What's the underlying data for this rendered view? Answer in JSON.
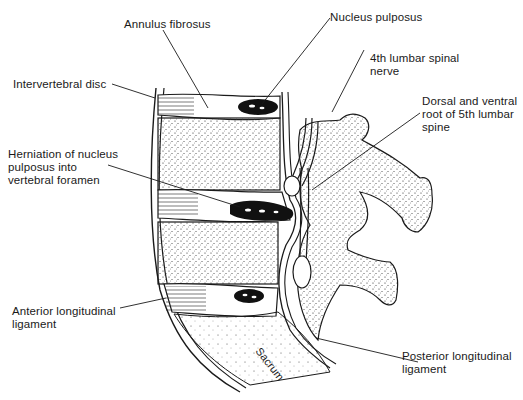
{
  "figure": {
    "type": "anatomical-diagram"
  },
  "labels": {
    "annulus_fibrosus": "Annulus fibrosus",
    "nucleus_pulposus": "Nucleus pulposus",
    "intervertebral_disc": "Intervertebral disc",
    "fourth_lumbar_nerve": "4th lumbar spinal\nnerve",
    "dorsal_ventral_root": "Dorsal and ventral\nroot of 5th lumbar\nspine",
    "herniation": "Herniation of nucleus\npulposus into\nvertebral foramen",
    "anterior_ligament": "Anterior longitudinal\nligament",
    "sacrum": "Sacrum",
    "posterior_ligament": "Posterior longitudinal\nligament"
  },
  "colors": {
    "ink": "#1a1a1a",
    "background": "#ffffff"
  }
}
